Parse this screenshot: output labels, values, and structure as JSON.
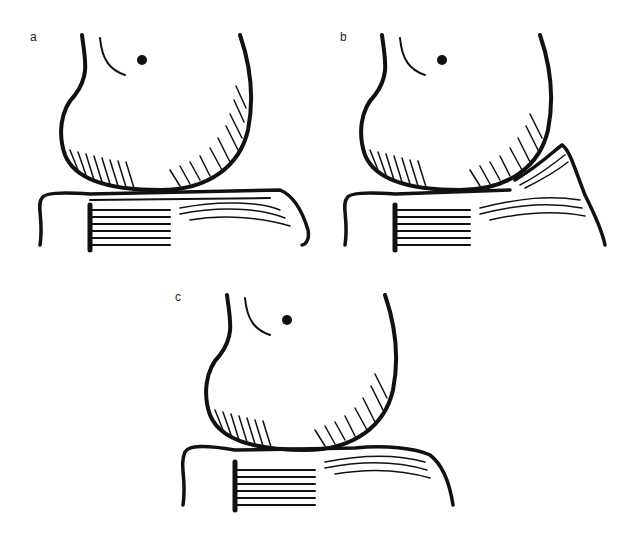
{
  "figure": {
    "panels": [
      {
        "id": "a",
        "label": "a",
        "description": "Knee joint illustration: femoral condyle resting on tibial plateau with meniscus lines"
      },
      {
        "id": "b",
        "label": "b",
        "description": "Knee joint illustration: meniscus displaced/lifted at posterior edge"
      },
      {
        "id": "c",
        "label": "c",
        "description": "Knee joint illustration: femoral condyle on tibial plateau, intact meniscus"
      }
    ],
    "colors": {
      "ink": "#111111",
      "background": "#ffffff"
    }
  }
}
